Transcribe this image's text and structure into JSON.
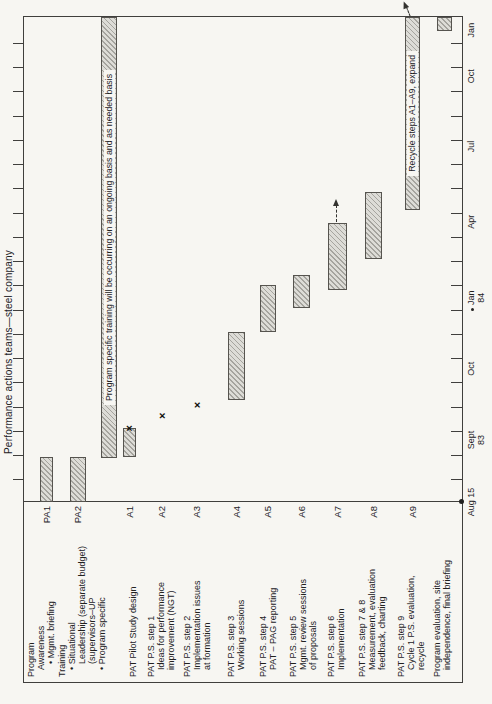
{
  "chart_data": {
    "type": "gantt",
    "title": "Performance actions teams—steel company",
    "axis": {
      "origin_dot": true,
      "tick_count": 19,
      "tick_start_frac": 0.0455,
      "tick_step_frac": 0.05,
      "labels": [
        {
          "text": "Aug 15",
          "frac": 0.0
        },
        {
          "text": "Sept",
          "sub": "83",
          "frac": 0.128
        },
        {
          "text": "Oct",
          "frac": 0.275
        },
        {
          "text": "Jan",
          "sub": "84",
          "frac": 0.421,
          "dot": true
        },
        {
          "text": "Apr",
          "frac": 0.578
        },
        {
          "text": "Jul",
          "frac": 0.733
        },
        {
          "text": "Oct",
          "frac": 0.878
        },
        {
          "text": "Jan",
          "frac": 0.973
        }
      ]
    },
    "rows": [
      {
        "id": "PA1",
        "label_y": 26,
        "lines": [
          {
            "t": "Program",
            "ind": 0
          },
          {
            "t": "Awareness",
            "ind": 1
          },
          {
            "t": "• Mgmt. briefing",
            "ind": 2
          }
        ],
        "bar": {
          "y": 40,
          "h": 13,
          "start": 0.0,
          "end": 0.093
        }
      },
      {
        "id": "PA2",
        "label_y": 57,
        "lines": [
          {
            "t": "Training",
            "ind": 0
          },
          {
            "t": "• Situational",
            "ind": 1
          },
          {
            "t": "Leadership (separate budget)",
            "ind": 2
          },
          {
            "t": "(supervisors–UP",
            "ind": 2
          },
          {
            "t": "• Program specific",
            "ind": 1
          }
        ],
        "bar": {
          "y": 70,
          "h": 16,
          "start": 0.0,
          "end": 0.093
        }
      },
      {
        "id": "",
        "label_y": 0,
        "lines": [],
        "bar": {
          "y": 101,
          "h": 16,
          "start": 0.091,
          "end": 1.0,
          "label": "Program specific training will be occurring on an ongoing basis and as needed basis"
        }
      },
      {
        "id": "A1",
        "label_y": 128,
        "lines": [
          {
            "t": "PAT Pilot Study design",
            "ind": 0
          }
        ],
        "bar": {
          "y": 123,
          "h": 13,
          "start": 0.093,
          "end": 0.152
        },
        "xmark": {
          "frac": 0.152,
          "y": 129
        }
      },
      {
        "id": "A2",
        "label_y": 146,
        "lines": [
          {
            "t": "PAT P.S. step 1",
            "ind": 0
          },
          {
            "t": "Ideas for performance",
            "ind": 1
          },
          {
            "t": "improvement (NGT)",
            "ind": 1
          }
        ],
        "xmark": {
          "frac": 0.178,
          "y": 162
        }
      },
      {
        "id": "A3",
        "label_y": 182,
        "lines": [
          {
            "t": "PAT P.S. step 2",
            "ind": 0
          },
          {
            "t": "Implementation issues",
            "ind": 1
          },
          {
            "t": "at formation",
            "ind": 1
          }
        ],
        "xmark": {
          "frac": 0.2,
          "y": 197
        }
      },
      {
        "id": "A4",
        "label_y": 226,
        "lines": [
          {
            "t": "PAT P.S. step 3",
            "ind": 0
          },
          {
            "t": "Working sessions",
            "ind": 1
          }
        ],
        "bar": {
          "y": 228,
          "h": 17,
          "start": 0.211,
          "end": 0.351
        }
      },
      {
        "id": "A5",
        "label_y": 258,
        "lines": [
          {
            "t": "PAT P.S. step 4",
            "ind": 0
          },
          {
            "t": "PAT – PAG reporting",
            "ind": 1
          }
        ],
        "bar": {
          "y": 260,
          "h": 16,
          "start": 0.351,
          "end": 0.448
        }
      },
      {
        "id": "A6",
        "label_y": 288,
        "lines": [
          {
            "t": "PAT P.S. step 5",
            "ind": 0
          },
          {
            "t": "Mgmt. review sessions",
            "ind": 1
          },
          {
            "t": "of proposals",
            "ind": 1
          }
        ],
        "bar": {
          "y": 293,
          "h": 17,
          "start": 0.401,
          "end": 0.469
        }
      },
      {
        "id": "A7",
        "label_y": 326,
        "lines": [
          {
            "t": "PAT P.S. step 6",
            "ind": 0
          },
          {
            "t": "Implementation",
            "ind": 1
          }
        ],
        "bar": {
          "y": 328,
          "h": 19,
          "start": 0.438,
          "end": 0.576
        },
        "arrow": {
          "from": 0.576,
          "to": 0.625,
          "y": 337
        }
      },
      {
        "id": "A8",
        "label_y": 357,
        "lines": [
          {
            "t": "PAT P.S. step 7 & 8",
            "ind": 0
          },
          {
            "t": "Measurement, evaluation",
            "ind": 1
          },
          {
            "t": "feedback, charting",
            "ind": 1
          }
        ],
        "bar": {
          "y": 365,
          "h": 17,
          "start": 0.5,
          "end": 0.64
        }
      },
      {
        "id": "A9",
        "label_y": 396,
        "lines": [
          {
            "t": "PAT P.S. step 9",
            "ind": 0
          },
          {
            "t": "Cycle 1 P.S. evaluation,",
            "ind": 1
          },
          {
            "t": "recycle",
            "ind": 1
          }
        ],
        "bar": {
          "y": 405,
          "h": 15,
          "start": 0.603,
          "end": 1.0,
          "label": "Recycle steps A1–A9, expand"
        },
        "arrow": {
          "from": 1.0,
          "to": 1.035,
          "y": 411,
          "angled": true
        }
      },
      {
        "id": "",
        "label_y": 432,
        "lines": [
          {
            "t": "Program evaluation, site",
            "ind": 0
          },
          {
            "t": "independence, final briefing",
            "ind": 1
          }
        ],
        "bar": {
          "y": 437,
          "h": 15,
          "start": 0.971,
          "end": 1.0
        }
      }
    ],
    "colors": {
      "background": "#f7f6f2",
      "line": "#403f3d",
      "bar_fill": "#dddcd7",
      "bar_hatch": "#6e6c66",
      "text": "#22211f"
    }
  }
}
